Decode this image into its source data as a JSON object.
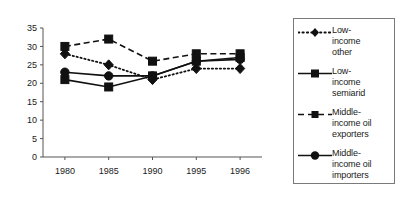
{
  "chart_data": {
    "type": "line",
    "title": "",
    "subtitle": "",
    "xlabel": "",
    "ylabel": "",
    "categories": [
      "1980",
      "1985",
      "1990",
      "1995",
      "1996"
    ],
    "ylim": [
      0,
      35
    ],
    "yticks": [
      0,
      5,
      10,
      15,
      20,
      25,
      30,
      35
    ],
    "grid": false,
    "legend_position": "right",
    "series": [
      {
        "name": "Low-income other",
        "label_lines": "Low-\nincome\nother",
        "values": [
          28,
          25,
          21,
          24,
          24
        ],
        "line_style": "dotted",
        "marker": "diamond",
        "color": "#111111"
      },
      {
        "name": "Low-income semiarid",
        "label_lines": "Low-\nincome\nsemiarid",
        "values": [
          21,
          19,
          22,
          26,
          27
        ],
        "line_style": "solid",
        "marker": "square",
        "color": "#111111"
      },
      {
        "name": "Middle-income oil exporters",
        "label_lines": "Middle-\nincome oil\nexporters",
        "values": [
          30,
          32,
          26,
          28,
          28
        ],
        "line_style": "dashed",
        "marker": "square",
        "color": "#111111"
      },
      {
        "name": "Middle-income oil importers",
        "label_lines": "Middle-\nincome oil\nimporters",
        "values": [
          23,
          22,
          22,
          26,
          26.5
        ],
        "line_style": "solid",
        "marker": "circle",
        "color": "#111111"
      }
    ]
  },
  "axes": {
    "ytick_labels": [
      "0",
      "5",
      "10",
      "15",
      "20",
      "25",
      "30",
      "35"
    ],
    "xtick_labels": [
      "1980",
      "1985",
      "1990",
      "1995",
      "1996"
    ]
  },
  "legend": {
    "items": [
      {
        "label": "Low-\nincome\nother"
      },
      {
        "label": "Low-\nincome\nsemiarid"
      },
      {
        "label": "Middle-\nincome oil\nexporters"
      },
      {
        "label": "Middle-\nincome oil\nimporters"
      }
    ]
  }
}
